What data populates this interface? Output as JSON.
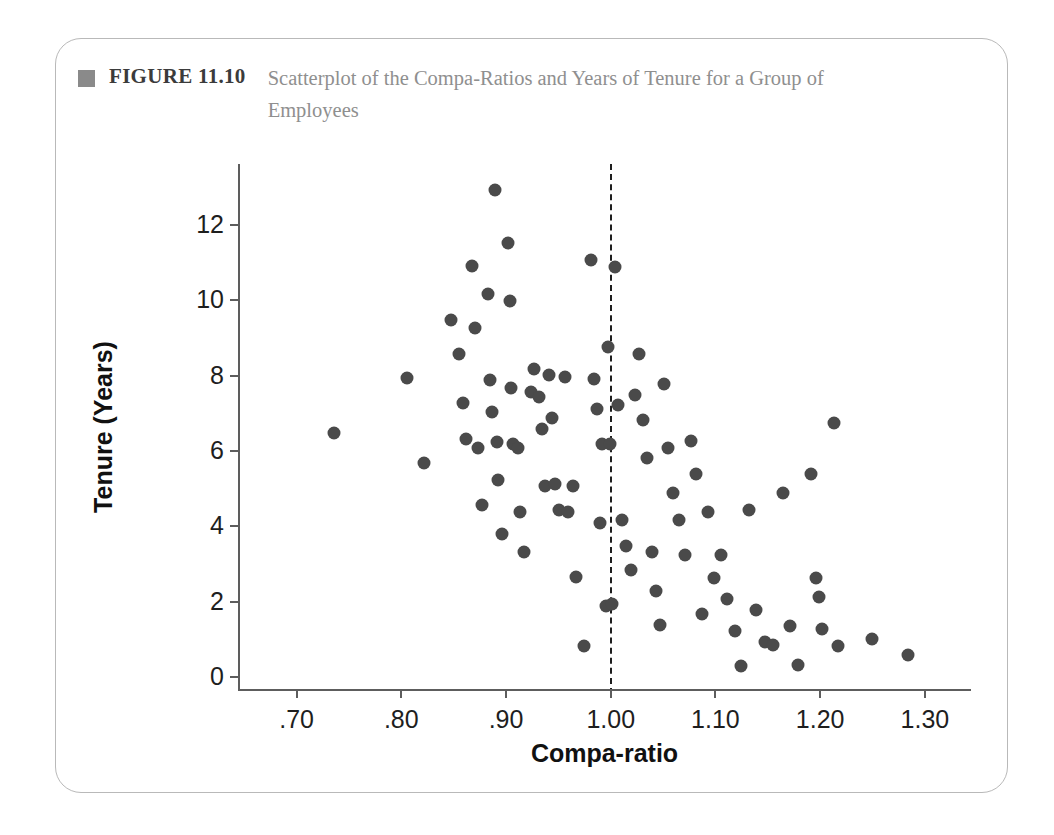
{
  "caption": {
    "marker": "square-marker",
    "label": "FIGURE 11.10",
    "text": "Scatterplot of the Compa-Ratios and Years of Tenure for a Group of Employees"
  },
  "colors": {
    "dot": "#4a4a4a",
    "axis": "#5d5d5d",
    "caption_text": "#8f8f8f",
    "caption_label": "#3b3b3b",
    "card_border": "#b9b9b9"
  },
  "chart_data": {
    "type": "scatter",
    "title": "Scatterplot of the Compa-Ratios and Years of Tenure for a Group of Employees",
    "xlabel": "Compa-ratio",
    "ylabel": "Tenure (Years)",
    "xlim": [
      0.645,
      1.345
    ],
    "ylim": [
      -0.35,
      13.6
    ],
    "xticks": [
      0.7,
      0.8,
      0.9,
      1.0,
      1.1,
      1.2,
      1.3
    ],
    "xticklabels": [
      ".70",
      ".80",
      ".90",
      "1.00",
      "1.10",
      "1.20",
      "1.30"
    ],
    "yticks": [
      0,
      2,
      4,
      6,
      8,
      10,
      12
    ],
    "yticklabels": [
      "0",
      "2",
      "4",
      "6",
      "8",
      "10",
      "12"
    ],
    "grid": false,
    "legend": null,
    "annotations": [
      {
        "kind": "vertical-reference-line",
        "x": 1.0,
        "style": "dashed",
        "label": "compa-ratio = 1.00"
      }
    ],
    "points": [
      [
        0.737,
        6.45
      ],
      [
        0.806,
        7.92
      ],
      [
        0.823,
        5.65
      ],
      [
        0.848,
        9.45
      ],
      [
        0.856,
        8.55
      ],
      [
        0.86,
        7.25
      ],
      [
        0.863,
        6.3
      ],
      [
        0.868,
        10.9
      ],
      [
        0.871,
        9.25
      ],
      [
        0.874,
        6.05
      ],
      [
        0.878,
        4.55
      ],
      [
        0.884,
        10.15
      ],
      [
        0.886,
        7.85
      ],
      [
        0.888,
        7.0
      ],
      [
        0.89,
        12.9
      ],
      [
        0.892,
        6.2
      ],
      [
        0.893,
        5.2
      ],
      [
        0.897,
        3.78
      ],
      [
        0.903,
        11.5
      ],
      [
        0.905,
        9.95
      ],
      [
        0.906,
        7.65
      ],
      [
        0.908,
        6.15
      ],
      [
        0.912,
        6.05
      ],
      [
        0.914,
        4.35
      ],
      [
        0.918,
        3.3
      ],
      [
        0.925,
        7.55
      ],
      [
        0.928,
        8.15
      ],
      [
        0.932,
        7.4
      ],
      [
        0.935,
        6.55
      ],
      [
        0.938,
        5.05
      ],
      [
        0.942,
        8.0
      ],
      [
        0.945,
        6.85
      ],
      [
        0.948,
        5.1
      ],
      [
        0.952,
        4.4
      ],
      [
        0.957,
        7.95
      ],
      [
        0.96,
        4.35
      ],
      [
        0.965,
        5.05
      ],
      [
        0.968,
        2.62
      ],
      [
        0.975,
        0.78
      ],
      [
        0.982,
        11.05
      ],
      [
        0.985,
        7.9
      ],
      [
        0.988,
        7.1
      ],
      [
        0.991,
        4.05
      ],
      [
        0.993,
        6.15
      ],
      [
        0.996,
        1.85
      ],
      [
        0.998,
        8.75
      ],
      [
        1.0,
        6.15
      ],
      [
        1.002,
        1.9
      ],
      [
        1.005,
        10.85
      ],
      [
        1.008,
        7.2
      ],
      [
        1.012,
        4.15
      ],
      [
        1.016,
        3.45
      ],
      [
        1.02,
        2.8
      ],
      [
        1.024,
        7.45
      ],
      [
        1.028,
        8.55
      ],
      [
        1.032,
        6.8
      ],
      [
        1.036,
        5.8
      ],
      [
        1.04,
        3.3
      ],
      [
        1.044,
        2.25
      ],
      [
        1.048,
        1.35
      ],
      [
        1.052,
        7.75
      ],
      [
        1.056,
        6.05
      ],
      [
        1.06,
        4.85
      ],
      [
        1.066,
        4.15
      ],
      [
        1.072,
        3.2
      ],
      [
        1.078,
        6.25
      ],
      [
        1.082,
        5.35
      ],
      [
        1.088,
        1.65
      ],
      [
        1.094,
        4.35
      ],
      [
        1.1,
        2.6
      ],
      [
        1.106,
        3.2
      ],
      [
        1.112,
        2.05
      ],
      [
        1.12,
        1.2
      ],
      [
        1.125,
        0.25
      ],
      [
        1.133,
        4.4
      ],
      [
        1.14,
        1.75
      ],
      [
        1.148,
        0.9
      ],
      [
        1.156,
        0.82
      ],
      [
        1.165,
        4.85
      ],
      [
        1.172,
        1.32
      ],
      [
        1.18,
        0.3
      ],
      [
        1.192,
        5.35
      ],
      [
        1.197,
        2.6
      ],
      [
        1.2,
        2.1
      ],
      [
        1.203,
        1.25
      ],
      [
        1.214,
        6.72
      ],
      [
        1.218,
        0.8
      ],
      [
        1.25,
        0.98
      ],
      [
        1.285,
        0.55
      ]
    ]
  }
}
